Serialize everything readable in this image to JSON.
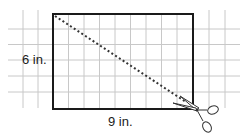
{
  "diagram": {
    "width_label": "9 in.",
    "height_label": "6 in.",
    "grid_unit_px": 15.55,
    "rectangle": {
      "cols": 9,
      "rows": 6
    },
    "colors": {
      "grid": "#c8c8c8",
      "rectangle": "#1a1a1a",
      "cut_line": "#333333",
      "text": "#1a1a1a"
    },
    "icons": [
      "scissors-icon"
    ]
  }
}
